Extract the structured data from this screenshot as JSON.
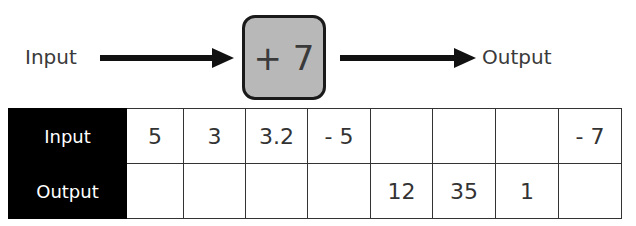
{
  "diagram": {
    "input_label": "Input",
    "function_label": "+ 7",
    "output_label": "Output",
    "colors": {
      "function_box_fill": "#b8b8b8",
      "function_box_border": "#1a1a1a",
      "arrow": "#111111",
      "header_fill": "#000000"
    }
  },
  "table": {
    "rows": [
      {
        "header": "Input",
        "cells": [
          "5",
          "3",
          "3.2",
          "- 5",
          "",
          "",
          "",
          "- 7"
        ]
      },
      {
        "header": "Output",
        "cells": [
          "",
          "",
          "",
          "",
          "12",
          "35",
          "1",
          ""
        ]
      }
    ]
  }
}
